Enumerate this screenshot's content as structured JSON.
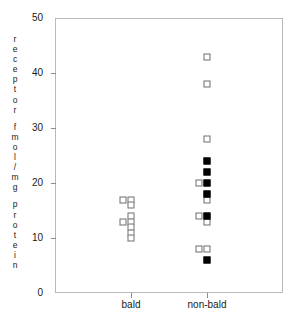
{
  "chart_data": {
    "type": "scatter",
    "title": "",
    "xlabel": "",
    "ylabel": "receptor fmol/mg protein",
    "ylabel_words": [
      "receptor",
      "fmol/mg",
      "protein"
    ],
    "categories": [
      "bald",
      "non-bald"
    ],
    "ylim": [
      0,
      50
    ],
    "yticks": [
      0,
      10,
      20,
      30,
      40,
      50
    ],
    "ytick_labels": [
      "0",
      "10",
      "20",
      "30",
      "40",
      "50"
    ],
    "grid": false,
    "legend": "none",
    "marker_styles": {
      "open": "open-square",
      "filled": "filled-square"
    },
    "series": [
      {
        "name": "open-square",
        "marker": "open",
        "points": [
          {
            "category": "bald",
            "value": 17,
            "offset": -1
          },
          {
            "category": "bald",
            "value": 17,
            "offset": 0
          },
          {
            "category": "bald",
            "value": 16,
            "offset": 0
          },
          {
            "category": "bald",
            "value": 14,
            "offset": 0
          },
          {
            "category": "bald",
            "value": 13,
            "offset": -1
          },
          {
            "category": "bald",
            "value": 13,
            "offset": 0
          },
          {
            "category": "bald",
            "value": 12,
            "offset": 0
          },
          {
            "category": "bald",
            "value": 11,
            "offset": 0
          },
          {
            "category": "bald",
            "value": 10,
            "offset": 0
          },
          {
            "category": "non-bald",
            "value": 43,
            "offset": 0
          },
          {
            "category": "non-bald",
            "value": 38,
            "offset": 0
          },
          {
            "category": "non-bald",
            "value": 28,
            "offset": 0
          },
          {
            "category": "non-bald",
            "value": 20,
            "offset": -1
          },
          {
            "category": "non-bald",
            "value": 17,
            "offset": 0
          },
          {
            "category": "non-bald",
            "value": 14,
            "offset": -1
          },
          {
            "category": "non-bald",
            "value": 13,
            "offset": 0
          },
          {
            "category": "non-bald",
            "value": 8,
            "offset": -1
          },
          {
            "category": "non-bald",
            "value": 8,
            "offset": 0
          }
        ]
      },
      {
        "name": "filled-square",
        "marker": "filled",
        "points": [
          {
            "category": "non-bald",
            "value": 24,
            "offset": 0
          },
          {
            "category": "non-bald",
            "value": 22,
            "offset": 0
          },
          {
            "category": "non-bald",
            "value": 20,
            "offset": 0
          },
          {
            "category": "non-bald",
            "value": 18,
            "offset": 0
          },
          {
            "category": "non-bald",
            "value": 14,
            "offset": 0
          },
          {
            "category": "non-bald",
            "value": 6,
            "offset": 0
          }
        ]
      }
    ]
  },
  "colors": {
    "frame": "#b9b9b9",
    "tick": "#8e8e8e",
    "open_marker_edge": "#6e6e6e",
    "filled_marker": "#000000",
    "text": "#1a1a1a",
    "background": "#ffffff"
  }
}
